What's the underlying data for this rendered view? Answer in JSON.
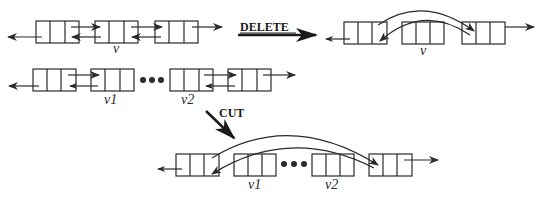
{
  "diagram": {
    "colors": {
      "stroke": "#2a2a2a",
      "background": "#ffffff"
    },
    "operations": [
      {
        "name": "DELETE",
        "label": "DELETE",
        "before": {
          "nodes": [
            "",
            "v",
            ""
          ],
          "description": "three linked nodes, middle node v"
        },
        "after": {
          "nodes": [
            "",
            "v",
            ""
          ],
          "description": "v detached; neighbors linked by curved arrows"
        }
      },
      {
        "name": "CUT",
        "label": "CUT",
        "before": {
          "nodes": [
            "",
            "v1",
            "...",
            "v2",
            ""
          ],
          "description": "segment v1..v2 inside list"
        },
        "after": {
          "nodes": [
            "",
            "v1",
            "...",
            "v2",
            ""
          ],
          "description": "segment v1..v2 removed; outer nodes linked by curved arrows"
        }
      }
    ],
    "labels": {
      "r1_v": "v",
      "r1r_v": "v",
      "r2_v1": "v1",
      "r2_v2": "v2",
      "r3_v1": "v1",
      "r3_v2": "v2",
      "delete": "DELETE",
      "cut": "CUT"
    }
  }
}
